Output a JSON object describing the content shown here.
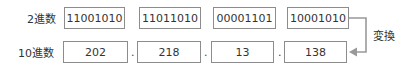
{
  "rows": {
    "binary": {
      "label": "2進数",
      "values": [
        "11001010",
        "11011010",
        "00001101",
        "10001010"
      ]
    },
    "decimal": {
      "label": "10進数",
      "values": [
        "202",
        "218",
        "13",
        "138"
      ],
      "separator": "."
    }
  },
  "arrow": {
    "label": "変換",
    "color": "#999999"
  }
}
